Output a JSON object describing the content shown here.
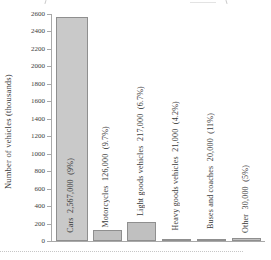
{
  "chart_data": {
    "type": "bar",
    "title": "",
    "xlabel": "",
    "ylabel": "Number of vehicles (thousands)",
    "ylim": [
      0,
      2600
    ],
    "y_tick_step": 200,
    "y_tick_labels": [
      "0",
      "200",
      "400",
      "600",
      "800",
      "1000",
      "1200",
      "1400",
      "1600",
      "1800",
      "2000",
      "2200",
      "2400",
      "2600"
    ],
    "grid": false,
    "legend": "none",
    "categories": [
      "Cars",
      "Motorcycles",
      "Light goods vehicles",
      "Heavy goods vehicles",
      "Buses and coaches",
      "Other"
    ],
    "values": [
      2567,
      126,
      217,
      21,
      20,
      30
    ],
    "bars": [
      {
        "category": "Cars",
        "value_thousands": 2567,
        "display_value": "2,567,000",
        "display_pct": "(9%)"
      },
      {
        "category": "Motorcycles",
        "value_thousands": 126,
        "display_value": "126,000",
        "display_pct": "(9.7%)"
      },
      {
        "category": "Light goods vehicles",
        "value_thousands": 217,
        "display_value": "217,000",
        "display_pct": "(6.7%)"
      },
      {
        "category": "Heavy goods vehicles",
        "value_thousands": 21,
        "display_value": "21,000",
        "display_pct": "(4.2%)"
      },
      {
        "category": "Buses and coaches",
        "value_thousands": 20,
        "display_value": "20,000",
        "display_pct": "(11%)"
      },
      {
        "category": "Other",
        "value_thousands": 30,
        "display_value": "30,000",
        "display_pct": "(5%)"
      }
    ],
    "colors": {
      "bar_fill": "#c0c0c0",
      "bar_fill_first": "#c9c9c9",
      "bar_border": "#8f8f8f",
      "axis": "#a9a9a9",
      "text": "#3a3a3a"
    }
  }
}
